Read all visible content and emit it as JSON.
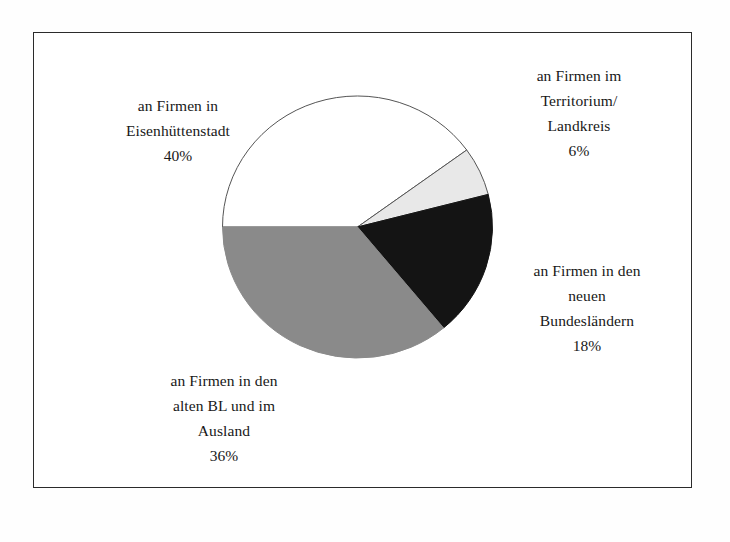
{
  "figure": {
    "frame_color": "#2b2b2b",
    "background_color": "#ffffff"
  },
  "chart_data": {
    "type": "pie",
    "title": "",
    "subtitle": "",
    "xlabel": "",
    "ylabel": "",
    "legend_position": "callout-labels",
    "grid": false,
    "unit": "%",
    "total": 100,
    "start_angle_deg": 270,
    "direction": "clockwise",
    "categories": [
      "an Firmen in Eisenhüttenstadt",
      "an Firmen im Territorium/ Landkreis",
      "an Firmen in den neuen Bundesländern",
      "an Firmen in den alten BL und im Ausland"
    ],
    "values": [
      40,
      6,
      18,
      36
    ],
    "colors": [
      "#ffffff",
      "#e8e8e8",
      "#141414",
      "#8a8a8a"
    ],
    "slices": [
      {
        "name": "an Firmen in Eisenhüttenstadt",
        "value": 40,
        "value_label": "40%",
        "color": "#ffffff",
        "stroke": "#555555",
        "start_deg": 270,
        "sweep_deg": 144
      },
      {
        "name": "an Firmen im Territorium/ Landkreis",
        "value": 6,
        "value_label": "6%",
        "color": "#e8e8e8",
        "stroke": "#555555",
        "start_deg": 54,
        "sweep_deg": 21.6
      },
      {
        "name": "an Firmen in den neuen Bundesländern",
        "value": 18,
        "value_label": "18%",
        "color": "#141414",
        "stroke": "#141414",
        "start_deg": 75.6,
        "sweep_deg": 64.8
      },
      {
        "name": "an Firmen in den alten BL und im Ausland",
        "value": 36,
        "value_label": "36%",
        "color": "#8a8a8a",
        "stroke": "#8a8a8a",
        "start_deg": 140.4,
        "sweep_deg": 129.6
      }
    ]
  },
  "labels": {
    "eisenhuettenstadt": {
      "line1": "an Firmen in",
      "line2": "Eisenhüttenstadt",
      "percent": "40%"
    },
    "territorium": {
      "line1": "an Firmen im",
      "line2": "Territorium/",
      "line3": "Landkreis",
      "percent": "6%"
    },
    "bundeslaender": {
      "line1": "an Firmen in den",
      "line2": "neuen",
      "line3": "Bundesländern",
      "percent": "18%"
    },
    "ausland": {
      "line1": "an Firmen in den",
      "line2": "alten BL und im",
      "line3": "Ausland",
      "percent": "36%"
    }
  }
}
